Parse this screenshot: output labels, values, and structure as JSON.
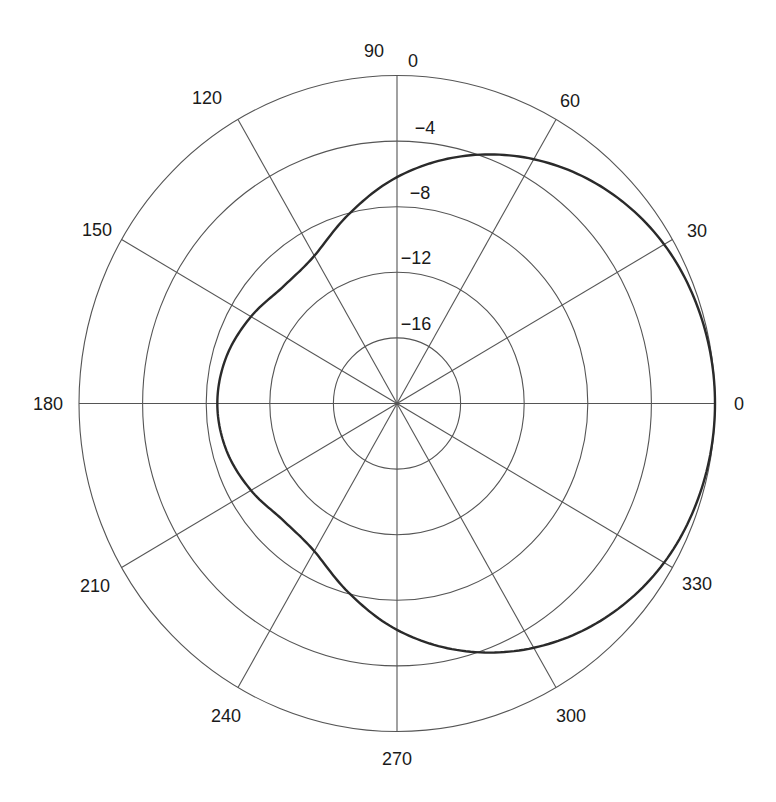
{
  "chart_data": {
    "type": "polar",
    "title": "",
    "subtitle": "",
    "xlabel": "",
    "ylabel": "",
    "legend": [],
    "grid": true,
    "angle_unit": "degrees",
    "angle_ticks": [
      0,
      30,
      60,
      90,
      120,
      150,
      180,
      210,
      240,
      270,
      300,
      330
    ],
    "angle_tick_labels": [
      "0",
      "30",
      "60",
      "90",
      "120",
      "150",
      "180",
      "210",
      "240",
      "270",
      "300",
      "330"
    ],
    "top_extra_label": "0",
    "radial_unit": "dB",
    "radial_range": [
      -20,
      0
    ],
    "radial_ticks": [
      -16,
      -12,
      -8,
      -4,
      0
    ],
    "radial_tick_labels": [
      "−16",
      "−12",
      "−8",
      "−4"
    ],
    "series": [
      {
        "name": "radiation pattern",
        "angles": [
          0,
          15,
          30,
          45,
          60,
          75,
          90,
          105,
          120,
          135,
          150,
          165,
          180,
          195,
          210,
          225,
          240,
          255,
          270,
          285,
          300,
          315,
          330,
          345
        ],
        "values": [
          0,
          -0.15,
          -0.6,
          -1.5,
          -2.8,
          -4.4,
          -6.2,
          -8.1,
          -9.6,
          -9.9,
          -9.4,
          -8.9,
          -8.7,
          -8.9,
          -9.4,
          -9.9,
          -9.6,
          -8.1,
          -6.2,
          -4.4,
          -2.8,
          -1.5,
          -0.6,
          -0.15
        ]
      }
    ]
  },
  "geometry": {
    "cx": 397,
    "cy": 403.5,
    "rx": 318,
    "ry": 328
  },
  "colors": {
    "grid": "#555555",
    "curve": "#2a2a2a",
    "text": "#1a1a1a",
    "background": "#ffffff"
  },
  "labels": {
    "a0": "0",
    "a30": "30",
    "a60": "60",
    "a90": "90",
    "a90_zero": "0",
    "a120": "120",
    "a150": "150",
    "a180": "180",
    "a210": "210",
    "a240": "240",
    "a270": "270",
    "a300": "300",
    "a330": "330",
    "r4": "−4",
    "r8": "−8",
    "r12": "−12",
    "r16": "−16"
  }
}
